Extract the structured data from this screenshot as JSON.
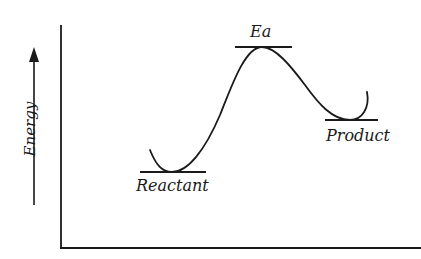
{
  "diagram": {
    "type": "reaction-energy-profile",
    "y_axis_label": "Energy",
    "labels": {
      "activation_energy": "Ea",
      "reactant": "Reactant",
      "product": "Product"
    },
    "colors": {
      "ink": "#1a1a1a",
      "background": "#ffffff"
    },
    "levels": {
      "reactant": {
        "x1": 140,
        "x2": 206,
        "y": 172
      },
      "transition_state": {
        "x1": 235,
        "x2": 292,
        "y": 47
      },
      "product": {
        "x1": 325,
        "x2": 378,
        "y": 120
      }
    }
  }
}
